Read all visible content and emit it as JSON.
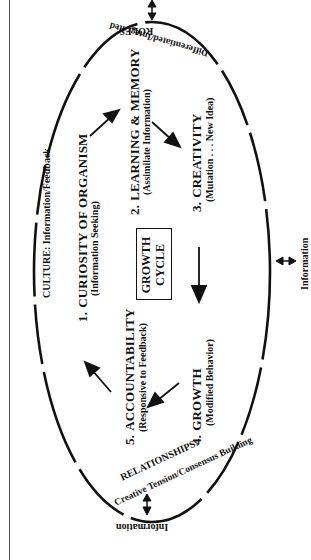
{
  "diagram": {
    "center_label_line1": "GROWTH",
    "center_label_line2": "CYCLE",
    "steps": [
      {
        "number": "1.",
        "title": "CURIOSITY OF ORGANISM",
        "subtitle": "(Information Seeking)"
      },
      {
        "number": "2.",
        "title": "LEARNING & MEMORY",
        "subtitle": "(Assimilate Information)"
      },
      {
        "number": "3.",
        "title": "CREATIVITY",
        "subtitle": "(Mutation . . . New Idea)"
      },
      {
        "number": "4.",
        "title": "GROWTH",
        "subtitle": "(Modified Behavior)"
      },
      {
        "number": "5.",
        "title": "ACCOUNTABILITY",
        "subtitle": "(Responsive to Feedback)"
      }
    ],
    "ring_labels": {
      "culture": "CULTURE: Information/Feedback",
      "roles_title": "ROLES:",
      "roles_sub": "Differentiated/Integrated",
      "relationships_title": "RELATIONSHIPS:",
      "relationships_sub": "Creative Tension/Consensus Building"
    },
    "external_labels": {
      "right": "Information",
      "bottom": "Information"
    },
    "icons": [
      "double-arrow-top",
      "double-arrow-right",
      "double-arrow-bottom",
      "cycle-arrow"
    ],
    "colors": {
      "ink": "#111111",
      "background": "#ffffff"
    }
  }
}
